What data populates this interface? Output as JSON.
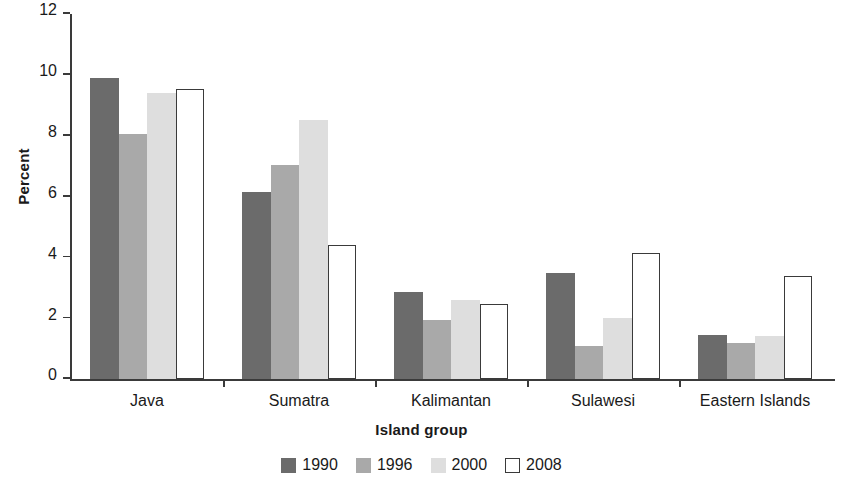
{
  "chart_data": {
    "type": "bar",
    "title": "",
    "xlabel": "Island group",
    "ylabel": "Percent",
    "categories": [
      "Java",
      "Sumatra",
      "Kalimantan",
      "Sulawesi",
      "Eastern Islands"
    ],
    "series": [
      {
        "name": "1990",
        "color": "#6b6b6b",
        "values": [
          9.9,
          6.15,
          2.85,
          3.5,
          1.45
        ]
      },
      {
        "name": "1996",
        "color": "#a9a9a9",
        "values": [
          8.05,
          7.05,
          1.95,
          1.1,
          1.2
        ]
      },
      {
        "name": "2000",
        "color": "#dedede",
        "values": [
          9.4,
          8.5,
          2.6,
          2.0,
          1.4
        ]
      },
      {
        "name": "2008",
        "color": "#ffffff",
        "values": [
          9.55,
          4.4,
          2.45,
          4.15,
          3.4
        ]
      }
    ],
    "ylim": [
      0,
      12
    ],
    "yticks": [
      0,
      2,
      4,
      6,
      8,
      10,
      12
    ],
    "ytick_labels": [
      "0",
      "2",
      "4",
      "6",
      "8",
      "10",
      "12"
    ],
    "grid": false,
    "legend_position": "bottom",
    "legend_entries": [
      "1990",
      "1996",
      "2000",
      "2008"
    ]
  }
}
